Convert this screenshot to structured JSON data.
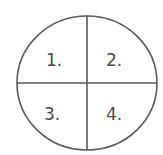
{
  "diagram": {
    "type": "quadrant-circle",
    "stroke_color": "#5a5a5a",
    "background": "#ffffff",
    "quadrants": [
      {
        "position": "top-left",
        "label": "1."
      },
      {
        "position": "top-right",
        "label": "2."
      },
      {
        "position": "bottom-left",
        "label": "3."
      },
      {
        "position": "bottom-right",
        "label": "4."
      }
    ]
  }
}
